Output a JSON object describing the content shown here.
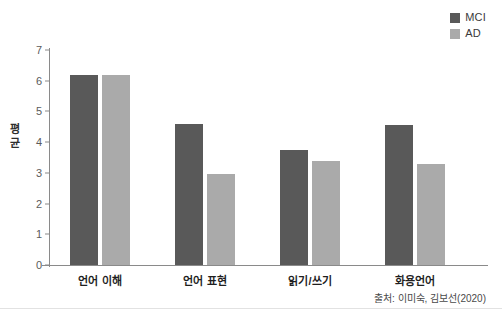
{
  "chart_data": {
    "type": "bar",
    "title": "",
    "xlabel": "",
    "ylabel": "평균",
    "ylabel_chars": [
      "평",
      "균"
    ],
    "ylim": [
      0,
      7
    ],
    "yticks": [
      0,
      1,
      2,
      3,
      4,
      5,
      6,
      7
    ],
    "ytick_labels": [
      "0",
      "1",
      "2",
      "3",
      "4",
      "5",
      "6",
      "7"
    ],
    "grid": false,
    "legend_position": "top-right",
    "categories": [
      "언어 이해",
      "언어 표현",
      "읽기/쓰기",
      "화용언어"
    ],
    "series": [
      {
        "name": "MCI",
        "color": "#595959",
        "values": [
          6.2,
          4.6,
          3.75,
          4.55
        ]
      },
      {
        "name": "AD",
        "color": "#aaaaaa",
        "values": [
          6.2,
          2.95,
          3.4,
          3.3
        ]
      }
    ],
    "source_note": "출처: 이미숙, 김보선(2020)"
  },
  "legend": {
    "items": [
      {
        "label": "MCI",
        "color": "#595959"
      },
      {
        "label": "AD",
        "color": "#aaaaaa"
      }
    ]
  },
  "axis": {
    "y_title_line1": "평",
    "y_title_line2": "균"
  },
  "footer": {
    "source": "출처: 이미숙, 김보선(2020)"
  }
}
